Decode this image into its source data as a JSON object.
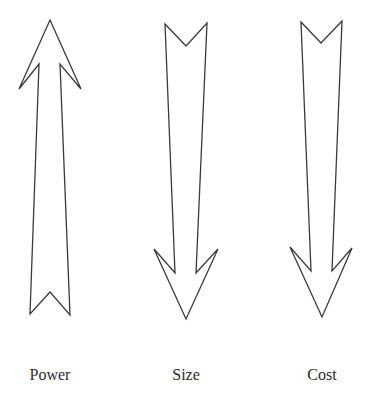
{
  "diagram": {
    "stroke_color": "#3a3a3a",
    "background": "#ffffff",
    "arrows": [
      {
        "id": "power",
        "label": "Power",
        "direction": "up",
        "label_x": 50,
        "points": "50,20 81,89 60,64 70,315 50,292 30,314 39,64 19,89"
      },
      {
        "id": "size",
        "label": "Size",
        "direction": "down",
        "label_x": 186,
        "points": "165,24 186,46 207,23 196,273 218,249 186,319 154,249 175,273"
      },
      {
        "id": "cost",
        "label": "Cost",
        "direction": "down",
        "label_x": 322,
        "points": "301,22 321,43 342,21 332,271 352,248 322,317 290,247 311,271"
      }
    ]
  }
}
